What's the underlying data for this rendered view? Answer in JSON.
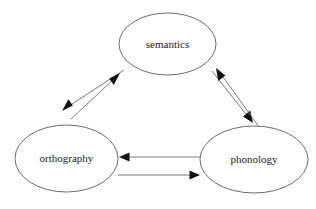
{
  "diagram": {
    "background_color": "#ffffff",
    "node_stroke_color": "#5a5a5a",
    "edge_color": "#6b6b6b",
    "arrowhead_color": "#111111",
    "label_color": "#1a1a1a",
    "nodes": [
      {
        "id": "semantics",
        "label": "semantics",
        "cx": 167.5,
        "cy": 44,
        "rx": 48.5,
        "ry": 31
      },
      {
        "id": "orthography",
        "label": "orthography",
        "cx": 66.5,
        "cy": 158.5,
        "rx": 51.5,
        "ry": 33.5
      },
      {
        "id": "phonology",
        "label": "phonology",
        "cx": 254,
        "cy": 159.5,
        "rx": 54,
        "ry": 33.5
      }
    ],
    "edges": [
      {
        "id": "semantics-to-orthography",
        "from": "semantics",
        "to": "orthography",
        "direction": "down-left",
        "x1": 124,
        "y1": 70,
        "x2": 62,
        "y2": 111
      },
      {
        "id": "orthography-to-semantics",
        "from": "orthography",
        "to": "semantics",
        "direction": "up-right",
        "x1": 71,
        "y1": 119,
        "x2": 120,
        "y2": 73
      },
      {
        "id": "semantics-to-phonology",
        "from": "semantics",
        "to": "phonology",
        "direction": "down-right",
        "x1": 212,
        "y1": 71,
        "x2": 253,
        "y2": 123
      },
      {
        "id": "phonology-to-semantics",
        "from": "phonology",
        "to": "semantics",
        "direction": "up-left",
        "x1": 259,
        "y1": 127,
        "x2": 216,
        "y2": 68
      },
      {
        "id": "phonology-to-orthography",
        "from": "phonology",
        "to": "orthography",
        "direction": "left",
        "x1": 201,
        "y1": 157,
        "x2": 119,
        "y2": 157
      },
      {
        "id": "orthography-to-phonology",
        "from": "orthography",
        "to": "phonology",
        "direction": "right",
        "x1": 118,
        "y1": 175,
        "x2": 200,
        "y2": 175
      }
    ]
  }
}
